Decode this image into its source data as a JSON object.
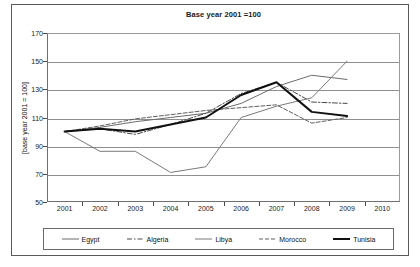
{
  "chart_data": {
    "type": "line",
    "title": "Base year 2001 =100",
    "xlabel": "",
    "ylabel": "[base year 2001 = 100]",
    "x": [
      "2001",
      "2002",
      "2003",
      "2004",
      "2005",
      "2006",
      "2007",
      "2008",
      "2009",
      "2010"
    ],
    "categories": [
      "2001",
      "2002",
      "2003",
      "2004",
      "2005",
      "2006",
      "2007",
      "2008",
      "2009",
      "2010"
    ],
    "ylim": [
      50,
      170
    ],
    "yticks": [
      50,
      70,
      90,
      110,
      130,
      150,
      170
    ],
    "grid": true,
    "legend_position": "bottom",
    "series": [
      {
        "name": "Egypt",
        "style": "solid",
        "color": "#6b6b6b",
        "width": 1,
        "x": [
          "2001",
          "2002",
          "2003",
          "2004",
          "2005",
          "2006",
          "2007",
          "2008",
          "2009"
        ],
        "values": [
          100,
          103,
          107,
          110,
          113,
          120,
          132,
          140,
          137
        ]
      },
      {
        "name": "Algeria",
        "style": "dash-dot",
        "color": "#4a4a4a",
        "width": 1,
        "x": [
          "2001",
          "2002",
          "2003",
          "2004",
          "2005",
          "2006",
          "2007",
          "2008",
          "2009"
        ],
        "values": [
          100,
          102,
          98,
          105,
          113,
          127,
          135,
          121,
          120
        ]
      },
      {
        "name": "Libya",
        "style": "solid",
        "color": "#7a7a7a",
        "width": 1,
        "x": [
          "2001",
          "2002",
          "2003",
          "2004",
          "2005",
          "2006",
          "2007",
          "2008",
          "2009"
        ],
        "values": [
          100,
          86,
          86,
          71,
          75,
          110,
          118,
          124,
          150
        ]
      },
      {
        "name": "Morocco",
        "style": "dashed",
        "color": "#5f5f5f",
        "width": 1,
        "x": [
          "2001",
          "2002",
          "2003",
          "2004",
          "2005",
          "2006",
          "2007",
          "2008",
          "2009"
        ],
        "values": [
          100,
          104,
          109,
          112,
          115,
          117,
          119,
          106,
          110
        ]
      },
      {
        "name": "Tunisia",
        "style": "solid",
        "color": "#111111",
        "width": 2,
        "x": [
          "2001",
          "2002",
          "2003",
          "2004",
          "2005",
          "2006",
          "2007",
          "2008",
          "2009"
        ],
        "values": [
          100,
          102,
          100,
          105,
          110,
          126,
          135,
          114,
          111
        ]
      }
    ]
  },
  "legend": {
    "items": [
      {
        "label": "Egypt"
      },
      {
        "label": "Algeria"
      },
      {
        "label": "Libya"
      },
      {
        "label": "Morocco"
      },
      {
        "label": "Tunisia"
      }
    ]
  }
}
